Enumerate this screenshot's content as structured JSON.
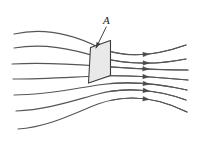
{
  "figure": {
    "background_color": "#ffffff",
    "width": 197,
    "height": 149,
    "label": {
      "text": "A",
      "x": 103,
      "y": 24,
      "points_to_x": 96,
      "points_to_y": 48
    },
    "plane": {
      "name": "area-A-parallelogram",
      "fill_color": "#e9e9e9",
      "stroke_color": "#3b3b3b",
      "corners": [
        [
          90.5,
          47.5
        ],
        [
          110.5,
          40.5
        ],
        [
          110.5,
          75.5
        ],
        [
          88.5,
          83.0
        ]
      ]
    },
    "line_color": "#565656",
    "arrow_color": "#4a4a4a",
    "arrow_x": 146,
    "field_lines": [
      {
        "name": "field-line-1",
        "path": "M 14,34 C 45,27 72,34 98,47 C 124,59 155,56 186,45",
        "arrow_t": 0.8,
        "has_arrow": true
      },
      {
        "name": "field-line-2",
        "path": "M 14,48 C 44,43 72,49 98,57 C 124,64 156,65 186,59",
        "arrow_t": 0.8,
        "has_arrow": true
      },
      {
        "name": "field-line-3",
        "path": "M 12,64 C 44,62 72,64 98,66 C 126,68 157,70 188,70",
        "arrow_t": 0.8,
        "has_arrow": true
      },
      {
        "name": "field-line-4",
        "path": "M 13,79 C 44,79 72,77 98,76 C 126,75 157,77 188,80",
        "arrow_t": 0.8,
        "has_arrow": true
      },
      {
        "name": "field-line-5",
        "path": "M 14,95 C 45,95 72,89 98,85 C 124,81 156,83 187,90",
        "arrow_t": 0.8,
        "has_arrow": true
      },
      {
        "name": "field-line-6",
        "path": "M 16,111 C 46,110 72,101 98,94 C 124,87 156,89 186,100",
        "arrow_t": 0.8,
        "has_arrow": true
      },
      {
        "name": "field-line-7",
        "path": "M 18,129 C 48,127 72,114 98,104 C 126,94 157,97 187,112",
        "arrow_t": 0.8,
        "has_arrow": true
      }
    ]
  }
}
